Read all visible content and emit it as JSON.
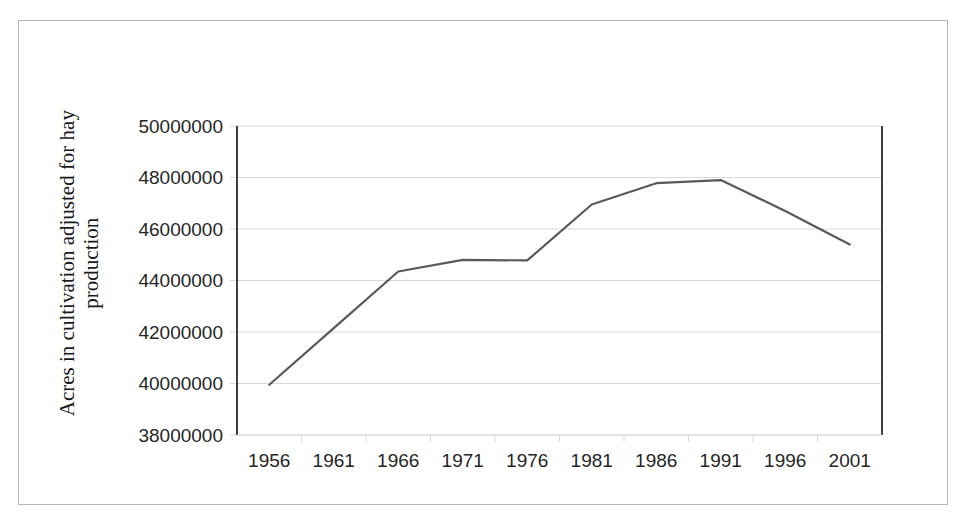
{
  "chart_data": {
    "type": "line",
    "title": "",
    "xlabel": "",
    "ylabel": "Acres in cultivation adjusted for hay production",
    "ylabel_line1": "Acres in cultivation adjusted for hay",
    "ylabel_line2": "production",
    "categories": [
      "1956",
      "1961",
      "1966",
      "1971",
      "1976",
      "1981",
      "1986",
      "1991",
      "1996",
      "2001"
    ],
    "values": [
      39950000,
      42150000,
      44350000,
      44800000,
      44780000,
      46950000,
      47780000,
      47900000,
      46700000,
      45400000
    ],
    "series": [
      {
        "name": "Acres in cultivation adjusted for hay production",
        "values": [
          39950000,
          42150000,
          44350000,
          44800000,
          44780000,
          46950000,
          47780000,
          47900000,
          46700000,
          45400000
        ],
        "color": "#595959"
      }
    ],
    "ylim": [
      38000000,
      50000000
    ],
    "ytick_step": 2000000,
    "ytick_labels": [
      "50000000",
      "48000000",
      "46000000",
      "44000000",
      "42000000",
      "40000000",
      "38000000"
    ],
    "ytick_values": [
      50000000,
      48000000,
      46000000,
      44000000,
      42000000,
      40000000,
      38000000
    ],
    "xtick_labels": [
      "1956",
      "1961",
      "1966",
      "1971",
      "1976",
      "1981",
      "1986",
      "1991",
      "1996",
      "2001"
    ],
    "grid": "horizontal",
    "legend": "none",
    "markers": "none",
    "colors": {
      "line": "#595959",
      "grid": "#d9d9d9",
      "axis": "#3f3f3f",
      "border": "#b5b5b5",
      "text": "#262626"
    }
  }
}
